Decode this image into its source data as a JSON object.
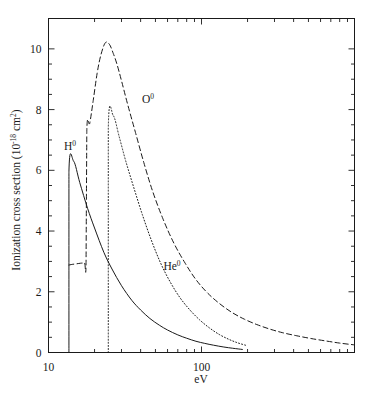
{
  "chart_data": {
    "type": "line",
    "title": "",
    "xlabel": "eV",
    "ylabel": "Ionization cross section (10⁻¹⁸ cm²)",
    "ylabel_main": "Ionization cross section (10",
    "ylabel_exp": "-18",
    "ylabel_tail": " cm",
    "ylabel_tail_exp": "2",
    "ylabel_close": ")",
    "xscale": "log",
    "yscale": "linear",
    "xlim": [
      10,
      1000
    ],
    "ylim": [
      0,
      11
    ],
    "grid": false,
    "legend_position": "inline-annotations",
    "x_tick_labels": [
      "10",
      "100"
    ],
    "x_tick_values": [
      10,
      100
    ],
    "x_minor_ticks": [
      20,
      30,
      40,
      50,
      60,
      70,
      80,
      90,
      200,
      300,
      400,
      500,
      600,
      700,
      800,
      900,
      1000
    ],
    "y_tick_labels": [
      "0",
      "2",
      "4",
      "6",
      "8",
      "10"
    ],
    "y_tick_values": [
      0,
      2,
      4,
      6,
      8,
      10
    ],
    "y_minor_step": 0.5,
    "series": [
      {
        "name": "H0",
        "label_main": "H",
        "label_exp": "0",
        "linestyle": "solid",
        "color": "#1a1a1a",
        "threshold_eV": 13.6,
        "peak_eV": 14.6,
        "peak_value": 6.3,
        "x": [
          13.6,
          13.6,
          14.6,
          16,
          18,
          20,
          23,
          26,
          30,
          35,
          40,
          46,
          53,
          60,
          70,
          80,
          92,
          105,
          120,
          140,
          160,
          185
        ],
        "y": [
          0,
          5.95,
          6.3,
          5.6,
          4.75,
          4.1,
          3.3,
          2.75,
          2.2,
          1.72,
          1.4,
          1.12,
          0.9,
          0.74,
          0.58,
          0.47,
          0.37,
          0.3,
          0.24,
          0.18,
          0.14,
          0.1
        ]
      },
      {
        "name": "He0",
        "label_main": "He",
        "label_exp": "0",
        "linestyle": "dotted",
        "color": "#1a1a1a",
        "threshold_eV": 24.6,
        "peak_eV": 26.5,
        "peak_value": 7.8,
        "x": [
          24.6,
          24.6,
          26.5,
          29,
          32,
          36,
          41,
          47,
          54,
          62,
          72,
          84,
          97,
          112,
          130,
          150,
          172,
          200
        ],
        "y": [
          0,
          7.4,
          7.8,
          7.1,
          6.3,
          5.45,
          4.55,
          3.7,
          2.95,
          2.35,
          1.82,
          1.4,
          1.08,
          0.82,
          0.6,
          0.44,
          0.32,
          0.22
        ]
      },
      {
        "name": "O0",
        "label_main": "O",
        "label_exp": "0",
        "linestyle": "dashed",
        "color": "#1a1a1a",
        "threshold_eV": 13.6,
        "peak_eV": 23.5,
        "peak_value": 10.2,
        "x": [
          13.6,
          14.2,
          15.2,
          16.2,
          17.2,
          17.6,
          17.8,
          18.6,
          19.6,
          20.8,
          22,
          23.5,
          25,
          26.5,
          28,
          30,
          33,
          37,
          42,
          48,
          56,
          66,
          78,
          92,
          110,
          132,
          158,
          190,
          230,
          280,
          340,
          420,
          520,
          650,
          800,
          1000
        ],
        "y": [
          2.88,
          2.9,
          2.92,
          2.94,
          2.95,
          2.96,
          7.3,
          7.55,
          8.3,
          9.2,
          9.8,
          10.2,
          10.15,
          9.85,
          9.5,
          8.95,
          8.15,
          7.25,
          6.25,
          5.3,
          4.4,
          3.6,
          2.95,
          2.4,
          1.95,
          1.6,
          1.32,
          1.1,
          0.92,
          0.77,
          0.65,
          0.55,
          0.46,
          0.38,
          0.31,
          0.25
        ]
      }
    ],
    "annotations": [
      {
        "text": "H0",
        "x_px": 70,
        "y_px": 150
      },
      {
        "text": "O0",
        "x_px": 148,
        "y_px": 103
      },
      {
        "text": "He0",
        "x_px": 172,
        "y_px": 270
      }
    ]
  }
}
